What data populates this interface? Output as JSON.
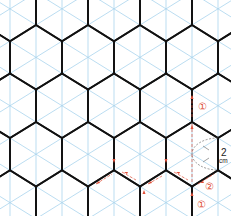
{
  "diagram": {
    "colors": {
      "grid": "#a9d4ee",
      "hex": "#111111",
      "annotation": "#e0513a",
      "dimension": "#222222"
    },
    "dimension_label": {
      "value": "2",
      "unit": "cm"
    },
    "step_labels": [
      {
        "id": "step-1-upper",
        "text": "①"
      },
      {
        "id": "step-2",
        "text": "②"
      },
      {
        "id": "step-1-lower",
        "text": "①"
      }
    ]
  }
}
